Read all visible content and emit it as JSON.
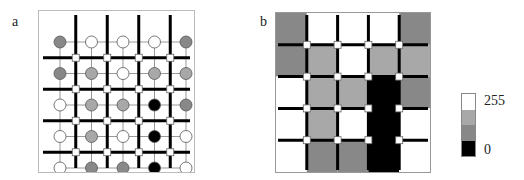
{
  "panels": {
    "a": {
      "label": "a"
    },
    "b": {
      "label": "b"
    }
  },
  "grid": {
    "rows": 5,
    "cols": 5,
    "levels": [
      [
        "dark",
        "white",
        "white",
        "white",
        "dark"
      ],
      [
        "dark",
        "gray",
        "white",
        "gray",
        "gray"
      ],
      [
        "white",
        "gray",
        "gray",
        "black",
        "dark"
      ],
      [
        "white",
        "gray",
        "white",
        "black",
        "white"
      ],
      [
        "white",
        "dark",
        "dark",
        "black",
        "white"
      ]
    ]
  },
  "colors": {
    "white": "#ffffff",
    "gray": "#a8a8a8",
    "dark": "#888888",
    "black": "#000000",
    "thick_line": "#000000",
    "thin_line": "#999999"
  },
  "colorbar": {
    "top_label": "255",
    "bottom_label": "0",
    "segments": [
      "#ffffff",
      "#a8a8a8",
      "#888888",
      "#000000"
    ]
  }
}
